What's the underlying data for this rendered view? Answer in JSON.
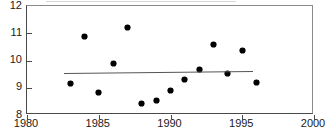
{
  "chart_data": {
    "type": "scatter",
    "title": "",
    "xlabel": "",
    "ylabel": "",
    "xlim": [
      1980,
      2000
    ],
    "ylim": [
      8,
      12
    ],
    "grid": false,
    "legend": null,
    "xticks": [
      "1980",
      "1985",
      "1990",
      "1995",
      "2000"
    ],
    "xtick_values": [
      1980,
      1985,
      1990,
      1995,
      2000
    ],
    "yticks": [
      "8",
      "9",
      "10",
      "11",
      "12"
    ],
    "ytick_values": [
      8,
      9,
      10,
      11,
      12
    ],
    "series": [
      {
        "name": "observations",
        "marker": "filled-diamond",
        "color": "#000000",
        "x": [
          1983,
          1984,
          1985,
          1986,
          1987,
          1988,
          1989,
          1990,
          1991,
          1992,
          1993,
          1994,
          1995,
          1996
        ],
        "y": [
          9.15,
          10.88,
          8.84,
          9.88,
          11.22,
          8.43,
          8.55,
          8.9,
          9.3,
          9.68,
          10.57,
          9.52,
          10.37,
          9.2
        ]
      },
      {
        "name": "trend-line",
        "type": "line",
        "color": "#555555",
        "x": [
          1982.6,
          1995.8
        ],
        "y": [
          9.55,
          9.62
        ]
      }
    ],
    "points": [
      {
        "label": "1983",
        "x": 1983,
        "y": 9.15
      },
      {
        "label": "1984",
        "x": 1984,
        "y": 10.88
      },
      {
        "label": "1985",
        "x": 1985,
        "y": 8.84
      },
      {
        "label": "1986",
        "x": 1986,
        "y": 9.88
      },
      {
        "label": "1987",
        "x": 1987,
        "y": 11.22
      },
      {
        "label": "1988",
        "x": 1988,
        "y": 8.43
      },
      {
        "label": "1989",
        "x": 1989,
        "y": 8.55
      },
      {
        "label": "1990",
        "x": 1990,
        "y": 8.9
      },
      {
        "label": "1991",
        "x": 1991,
        "y": 9.3
      },
      {
        "label": "1992",
        "x": 1992,
        "y": 9.68
      },
      {
        "label": "1993",
        "x": 1993,
        "y": 10.57
      },
      {
        "label": "1994",
        "x": 1994,
        "y": 9.52
      },
      {
        "label": "1995",
        "x": 1995,
        "y": 10.37
      },
      {
        "label": "1996",
        "x": 1996,
        "y": 9.2
      }
    ]
  }
}
